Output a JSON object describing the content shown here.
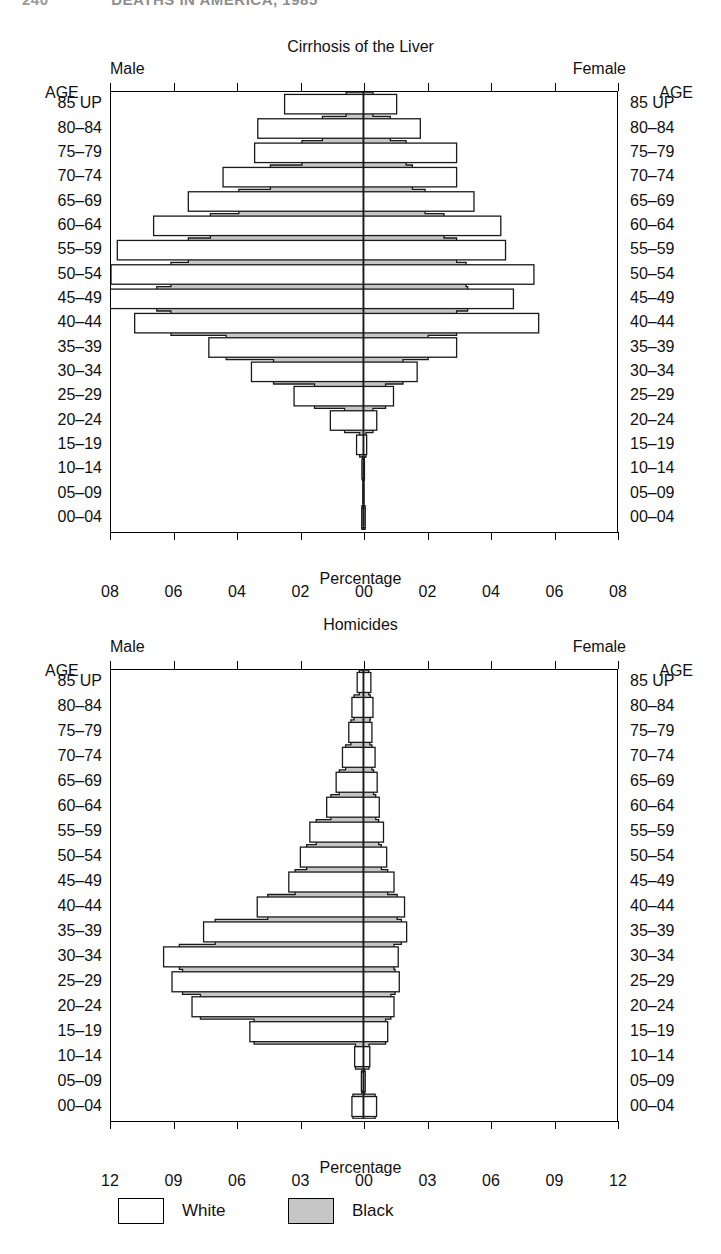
{
  "running_header": {
    "page_number": "240",
    "title": "DEATHS IN AMERICA, 1985"
  },
  "legend": {
    "items": [
      {
        "label": "White",
        "color": "#ffffff",
        "name": "legend-white"
      },
      {
        "label": "Black",
        "color": "#c6c6c6",
        "name": "legend-black"
      }
    ]
  },
  "age_groups": [
    "85 UP",
    "80–84",
    "75–79",
    "70–74",
    "65–69",
    "60–64",
    "55–59",
    "50–54",
    "45–49",
    "40–44",
    "35–39",
    "30–34",
    "25–29",
    "20–24",
    "15–19",
    "10–14",
    "05–09",
    "00–04"
  ],
  "age_header": "AGE",
  "side_labels": {
    "male": "Male",
    "female": "Female"
  },
  "axis_title": "Percentage",
  "chart_data": [
    {
      "type": "bar",
      "orientation": "population-pyramid",
      "title": "Cirrhosis of the Liver",
      "xlabel": "Percentage",
      "ylabel": "AGE",
      "xlim": [
        -8,
        8
      ],
      "xticks": [
        -8,
        -6,
        -4,
        -2,
        0,
        2,
        4,
        6,
        8
      ],
      "xticklabels": [
        "08",
        "06",
        "04",
        "02",
        "00",
        "02",
        "04",
        "06",
        "08"
      ],
      "grid": false,
      "legend_position": "bottom-of-figure",
      "categories": [
        "85 UP",
        "80–84",
        "75–79",
        "70–74",
        "65–69",
        "60–64",
        "55–59",
        "50–54",
        "45–49",
        "40–44",
        "35–39",
        "30–34",
        "25–29",
        "20–24",
        "15–19",
        "10–14",
        "05–09",
        "00–04"
      ],
      "series": [
        {
          "name": "White",
          "side": "Male",
          "values": [
            2.5,
            3.35,
            3.45,
            4.45,
            5.55,
            6.65,
            7.8,
            8.0,
            8.1,
            7.25,
            4.9,
            3.55,
            2.2,
            1.05,
            0.22,
            0.05,
            0.02,
            0.05
          ]
        },
        {
          "name": "Black",
          "side": "Male",
          "values": [
            0.55,
            1.3,
            1.95,
            2.95,
            3.95,
            4.85,
            5.55,
            6.1,
            6.55,
            6.1,
            4.35,
            2.85,
            1.55,
            0.6,
            0.12,
            0.03,
            0.01,
            0.05
          ]
        },
        {
          "name": "White",
          "side": "Female",
          "values": [
            1.05,
            1.8,
            2.95,
            2.95,
            3.5,
            4.35,
            4.5,
            5.4,
            4.75,
            5.55,
            2.95,
            1.7,
            0.95,
            0.42,
            0.1,
            0.03,
            0.01,
            0.05
          ]
        },
        {
          "name": "Black",
          "side": "Female",
          "values": [
            0.3,
            0.85,
            1.35,
            1.55,
            1.95,
            2.55,
            2.95,
            3.25,
            3.3,
            2.95,
            2.05,
            1.25,
            0.7,
            0.3,
            0.08,
            0.02,
            0.01,
            0.05
          ]
        }
      ]
    },
    {
      "type": "bar",
      "orientation": "population-pyramid",
      "title": "Homicides",
      "xlabel": "Percentage",
      "ylabel": "AGE",
      "xlim": [
        -12,
        12
      ],
      "xticks": [
        -12,
        -9,
        -6,
        -3,
        0,
        3,
        6,
        9,
        12
      ],
      "xticklabels": [
        "12",
        "09",
        "06",
        "03",
        "00",
        "03",
        "06",
        "09",
        "12"
      ],
      "grid": false,
      "legend_position": "bottom-of-figure",
      "categories": [
        "85 UP",
        "80–84",
        "75–79",
        "70–74",
        "65–69",
        "60–64",
        "55–59",
        "50–54",
        "45–49",
        "40–44",
        "35–39",
        "30–34",
        "25–29",
        "20–24",
        "15–19",
        "10–14",
        "05–09",
        "00–04"
      ],
      "series": [
        {
          "name": "White",
          "side": "Male",
          "values": [
            0.3,
            0.55,
            0.7,
            1.0,
            1.3,
            1.75,
            2.55,
            3.0,
            3.55,
            5.05,
            7.6,
            9.5,
            9.1,
            8.15,
            5.4,
            0.42,
            0.1,
            0.55
          ]
        },
        {
          "name": "Black",
          "side": "Male",
          "values": [
            0.2,
            0.45,
            0.6,
            0.85,
            1.15,
            1.55,
            2.25,
            2.7,
            3.25,
            4.55,
            7.05,
            8.75,
            8.6,
            7.75,
            5.2,
            0.38,
            0.08,
            0.5
          ]
        },
        {
          "name": "White",
          "side": "Female",
          "values": [
            0.35,
            0.45,
            0.4,
            0.55,
            0.65,
            0.75,
            0.95,
            1.1,
            1.45,
            1.95,
            2.05,
            1.65,
            1.7,
            1.45,
            1.15,
            0.3,
            0.08,
            0.62
          ]
        },
        {
          "name": "Black",
          "side": "Female",
          "values": [
            0.25,
            0.32,
            0.3,
            0.4,
            0.48,
            0.58,
            0.72,
            0.85,
            1.15,
            1.6,
            1.8,
            1.45,
            1.5,
            1.3,
            1.05,
            0.26,
            0.06,
            0.55
          ]
        }
      ]
    }
  ]
}
